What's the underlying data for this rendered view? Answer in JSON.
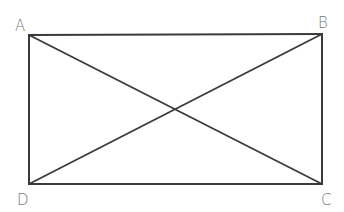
{
  "diagram": {
    "type": "rectangle-with-diagonals",
    "vertices": {
      "A": {
        "label": "A",
        "x": 29,
        "y": 35
      },
      "B": {
        "label": "B",
        "x": 322,
        "y": 34
      },
      "C": {
        "label": "C",
        "x": 322,
        "y": 184
      },
      "D": {
        "label": "D",
        "x": 29,
        "y": 184
      }
    },
    "edges": [
      [
        "A",
        "B"
      ],
      [
        "B",
        "C"
      ],
      [
        "C",
        "D"
      ],
      [
        "D",
        "A"
      ]
    ],
    "diagonals": [
      [
        "A",
        "C"
      ],
      [
        "B",
        "D"
      ]
    ],
    "colors": {
      "line": "#3a3a3a",
      "label": "#777777"
    }
  }
}
